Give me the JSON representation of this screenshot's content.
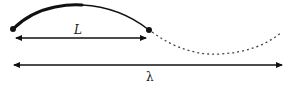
{
  "diagram": {
    "type": "wave-segment-illustration",
    "labels": {
      "segment_length": "L",
      "wavelength": "λ"
    },
    "colors": {
      "stroke": "#111111",
      "dashed_stroke": "#444444",
      "background": "#ffffff"
    },
    "elements": {
      "solid_arc": "curved segment between two endpoint dots",
      "dashed_curve": "continuation of the wave shown as dotted line",
      "L_arrow": "double-headed arrow spanning segment length L",
      "lambda_arrow": "double-headed arrow spanning full wavelength λ"
    }
  }
}
